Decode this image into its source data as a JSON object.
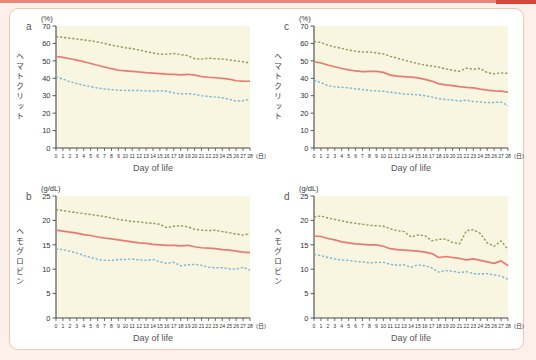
{
  "page": {
    "background": "#fbf0ea",
    "top_strip_color": "#e8867a",
    "top_strip_end_color": "#d6473a",
    "card_background": "#ffffff",
    "card_border_color": "#f1c5b2",
    "plot_background": "#f8f5e0",
    "axis_color": "#4a4a4a",
    "tick_text_color": "#333333",
    "xlabel_color": "#555555"
  },
  "chart_data": [
    {
      "id": "a",
      "panel_label": "a",
      "type": "line",
      "ylabel": "ヘマトクリット",
      "y_unit": "(%)",
      "xlabel": "Day of life",
      "x_unit": "(日)",
      "x_days": {
        "min": 0,
        "max": 28,
        "step": 1
      },
      "ylim": [
        0,
        70
      ],
      "ytick_step": 10,
      "grid": false,
      "legend": "none",
      "series": [
        {
          "name": "upper-dashed-green",
          "color": "#8a9c52",
          "style": "dashed",
          "values": [
            64,
            63.5,
            63,
            62.5,
            62,
            61.5,
            60.8,
            60,
            59,
            58.3,
            57.5,
            57,
            56.2,
            55.3,
            54.6,
            53.8,
            53.9,
            54.2,
            53.6,
            53,
            51.2,
            51,
            51.5,
            51.2,
            51,
            50.6,
            50,
            49.5,
            48.7
          ]
        },
        {
          "name": "mean-solid-red",
          "color": "#e87b70",
          "style": "solid",
          "values": [
            52.5,
            52,
            51.2,
            50.4,
            49.5,
            48.5,
            47.5,
            46.5,
            45.5,
            44.6,
            44.3,
            44,
            43.6,
            43.2,
            43,
            42.7,
            42.4,
            42.2,
            42,
            42.3,
            41.8,
            41,
            40.6,
            40.3,
            40,
            39.5,
            38.6,
            38.4,
            38.3
          ]
        },
        {
          "name": "lower-dashed-blue",
          "color": "#72b7da",
          "style": "dashed",
          "values": [
            41,
            39.5,
            38,
            37,
            36,
            35.2,
            34.4,
            33.9,
            33.5,
            33.2,
            33,
            33,
            33,
            32.8,
            32.6,
            32.9,
            32.6,
            31.6,
            31,
            31.2,
            30.8,
            30,
            29.6,
            29.2,
            28.8,
            28,
            26.9,
            27.2,
            27.8
          ]
        }
      ]
    },
    {
      "id": "c",
      "panel_label": "c",
      "type": "line",
      "ylabel": "ヘマトクリット",
      "y_unit": "(%)",
      "xlabel": "Day of life",
      "x_unit": "(日)",
      "x_days": {
        "min": 0,
        "max": 28,
        "step": 1
      },
      "ylim": [
        0,
        70
      ],
      "ytick_step": 10,
      "grid": false,
      "legend": "none",
      "series": [
        {
          "name": "upper-dashed-green",
          "color": "#8a9c52",
          "style": "dashed",
          "values": [
            61,
            60.6,
            59,
            58,
            57.2,
            56.2,
            55.6,
            55,
            55.1,
            54.5,
            54,
            52.6,
            51.6,
            50.4,
            49.4,
            48.4,
            47.6,
            47,
            46.4,
            45.4,
            44.6,
            44,
            45.8,
            45.2,
            45.6,
            43.2,
            42.6,
            43.1,
            42.8
          ]
        },
        {
          "name": "mean-solid-red",
          "color": "#e87b70",
          "style": "solid",
          "values": [
            49.5,
            48.8,
            47.6,
            46.6,
            45.6,
            44.8,
            44.2,
            43.8,
            44,
            44,
            43.4,
            41.8,
            41.2,
            41,
            40.7,
            40.2,
            39.4,
            38.4,
            36.8,
            36.2,
            35.8,
            35.2,
            34.8,
            34.5,
            33.8,
            33.2,
            32.8,
            32.6,
            32
          ]
        },
        {
          "name": "lower-dashed-blue",
          "color": "#72b7da",
          "style": "dashed",
          "values": [
            39,
            37.5,
            35.8,
            35.1,
            34.8,
            34.5,
            34,
            33.5,
            33,
            32.8,
            32.5,
            32,
            31.5,
            31,
            30.8,
            30.5,
            30,
            29.3,
            28.3,
            27.8,
            27.5,
            27,
            27.4,
            26.6,
            26.4,
            26,
            26.1,
            26.4,
            24.2
          ]
        }
      ]
    },
    {
      "id": "b",
      "panel_label": "b",
      "type": "line",
      "ylabel": "ヘモグロビン",
      "y_unit": "(g/dL)",
      "xlabel": "Day of life",
      "x_unit": "(日)",
      "x_days": {
        "min": 0,
        "max": 28,
        "step": 1
      },
      "ylim": [
        0,
        25
      ],
      "ytick_step": 5,
      "grid": false,
      "legend": "none",
      "series": [
        {
          "name": "upper-dashed-green",
          "color": "#8a9c52",
          "style": "dashed",
          "values": [
            22.2,
            22,
            21.8,
            21.6,
            21.4,
            21.2,
            21,
            20.8,
            20.5,
            20.2,
            20,
            19.8,
            19.7,
            19.5,
            19.4,
            19.2,
            18.5,
            18.8,
            18.9,
            18.7,
            18.2,
            18,
            17.9,
            18,
            17.7,
            17.5,
            17.2,
            17,
            17.3
          ]
        },
        {
          "name": "mean-solid-red",
          "color": "#e87b70",
          "style": "solid",
          "values": [
            18,
            17.8,
            17.6,
            17.4,
            17.1,
            16.9,
            16.6,
            16.4,
            16.2,
            16,
            15.8,
            15.6,
            15.4,
            15.3,
            15.1,
            15,
            14.9,
            14.9,
            14.8,
            14.9,
            14.6,
            14.4,
            14.3,
            14.2,
            14,
            13.9,
            13.7,
            13.5,
            13.4
          ]
        },
        {
          "name": "lower-dashed-blue",
          "color": "#72b7da",
          "style": "dashed",
          "values": [
            14.2,
            14,
            13.7,
            13.3,
            12.8,
            12.4,
            12,
            11.8,
            11.8,
            12,
            12,
            12.1,
            11.9,
            11.8,
            12,
            11.5,
            11.2,
            11.4,
            10.7,
            10.9,
            11,
            10.8,
            10.4,
            10.3,
            10.3,
            10.1,
            10,
            10.4,
            9.8
          ]
        }
      ]
    },
    {
      "id": "d",
      "panel_label": "d",
      "type": "line",
      "ylabel": "ヘモグロビン",
      "y_unit": "(g/dL)",
      "xlabel": "Day of life",
      "x_unit": "(日)",
      "x_days": {
        "min": 0,
        "max": 28,
        "step": 1
      },
      "ylim": [
        0,
        25
      ],
      "ytick_step": 5,
      "grid": false,
      "legend": "none",
      "series": [
        {
          "name": "upper-dashed-green",
          "color": "#8a9c52",
          "style": "dashed",
          "values": [
            20.7,
            20.9,
            20.5,
            20.2,
            19.9,
            19.6,
            19.4,
            19.2,
            19,
            18.9,
            18.8,
            18.3,
            17.9,
            17.7,
            16.6,
            17,
            16.9,
            15.8,
            16.1,
            16.2,
            15.5,
            15.2,
            17.9,
            18.1,
            17.3,
            15.4,
            14.7,
            15.8,
            14
          ]
        },
        {
          "name": "mean-solid-red",
          "color": "#e87b70",
          "style": "solid",
          "values": [
            16.8,
            16.7,
            16.3,
            16,
            15.6,
            15.4,
            15.2,
            15.1,
            15,
            15,
            14.7,
            14.2,
            14,
            13.9,
            13.8,
            13.7,
            13.5,
            13.2,
            12.4,
            12.6,
            12.4,
            12.2,
            11.9,
            12.1,
            11.8,
            11.5,
            11.2,
            11.7,
            10.7
          ]
        },
        {
          "name": "lower-dashed-blue",
          "color": "#72b7da",
          "style": "dashed",
          "values": [
            13,
            12.8,
            12.4,
            12.1,
            11.9,
            11.8,
            11.6,
            11.5,
            11.3,
            11.4,
            11.4,
            11,
            10.8,
            10.9,
            10.4,
            10.9,
            10.7,
            10.3,
            9.4,
            9.7,
            9.6,
            9.3,
            9.5,
            9.1,
            9,
            9.1,
            8.8,
            8.6,
            7.9
          ]
        }
      ]
    }
  ]
}
